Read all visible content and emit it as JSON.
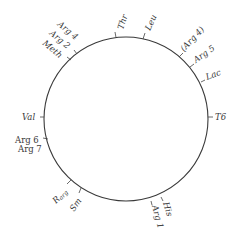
{
  "diagram": {
    "title": "",
    "type": "circular genetic map",
    "circle": {
      "cx": 126,
      "cy": 119,
      "r": 82,
      "stroke": "#3a3a3a"
    },
    "markers": [
      {
        "id": "thr",
        "label": "Thr",
        "angle": 97,
        "italic": true,
        "rot": -70,
        "dx": 0,
        "dy": 0
      },
      {
        "id": "leu",
        "label": "Leu",
        "angle": 78,
        "italic": true,
        "rot": -62,
        "dx": 0,
        "dy": 0
      },
      {
        "id": "arg4b",
        "label": "(Arg 4)",
        "angle": 58,
        "italic": true,
        "rot": -45,
        "dx": 0,
        "dy": 0
      },
      {
        "id": "arg5",
        "label": "Arg 5",
        "angle": 43,
        "italic": true,
        "rot": -33,
        "dx": 0,
        "dy": 0
      },
      {
        "id": "lac",
        "label": "Lac",
        "angle": 27,
        "italic": true,
        "rot": -20,
        "dx": 0,
        "dy": 0
      },
      {
        "id": "t6",
        "label": "T6",
        "angle": 0,
        "italic": true,
        "rot": 0,
        "dx": 0,
        "dy": 0
      },
      {
        "id": "his",
        "label": "His",
        "angle": -77,
        "italic": true,
        "rot": 72,
        "dx": 0,
        "dy": 0
      },
      {
        "id": "arg1",
        "label": "Arg 1",
        "angle": -83,
        "italic": true,
        "rot": 75,
        "dx": 0,
        "dy": 0
      },
      {
        "id": "sm",
        "label": "Sm",
        "angle": -125,
        "italic": true,
        "rot": -55,
        "dx": 0,
        "dy": 0
      },
      {
        "id": "rarg",
        "label": "Rarg",
        "angle": -135,
        "italic": true,
        "rot": -45,
        "dx": 0,
        "dy": 0
      },
      {
        "id": "arg67",
        "label": "Arg 6",
        "label2": "Arg 7",
        "angle": -192,
        "italic": false,
        "rot": 0,
        "dx": 0,
        "dy": 0
      },
      {
        "id": "val",
        "label": "Val",
        "angle": 180,
        "italic": true,
        "rot": 0,
        "dx": 0,
        "dy": 0
      },
      {
        "id": "meth",
        "label": "Meth",
        "angle": 127,
        "italic": true,
        "rot": 40,
        "dx": 0,
        "dy": 0
      },
      {
        "id": "arg2",
        "label": "Arg 2",
        "angle": 127,
        "italic": true,
        "rot": 40,
        "dx": 0,
        "dy": 0
      },
      {
        "id": "arg4",
        "label": "Arg 4",
        "angle": 121,
        "italic": true,
        "rot": 40,
        "dx": 0,
        "dy": 0
      }
    ]
  }
}
